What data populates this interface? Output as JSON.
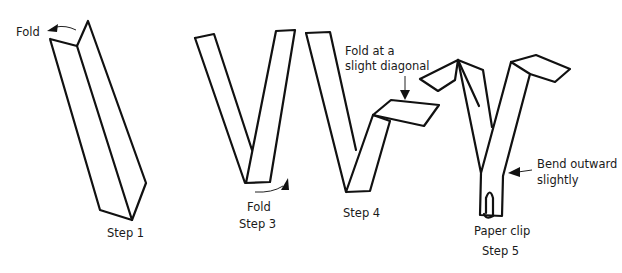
{
  "diagram": {
    "type": "instructional-steps",
    "stroke_color": "#111111",
    "background": "#ffffff",
    "steps": [
      {
        "id": "step1",
        "label": "Step 1",
        "annotations": [
          {
            "text": "Fold",
            "arrow": "curved-left"
          }
        ]
      },
      {
        "id": "step3",
        "label": "Step 3",
        "annotations": [
          {
            "text": "Fold",
            "arrow": "curved-up-right"
          }
        ]
      },
      {
        "id": "step4",
        "label": "Step 4",
        "annotations": [
          {
            "line1": "Fold at a",
            "line2": "slight diagonal",
            "arrow": "down"
          }
        ]
      },
      {
        "id": "step5",
        "label": "Step 5",
        "annotations": [
          {
            "line1": "Bend outward",
            "line2": "slightly",
            "arrow": "left"
          },
          {
            "text": "Paper clip"
          }
        ]
      }
    ]
  }
}
